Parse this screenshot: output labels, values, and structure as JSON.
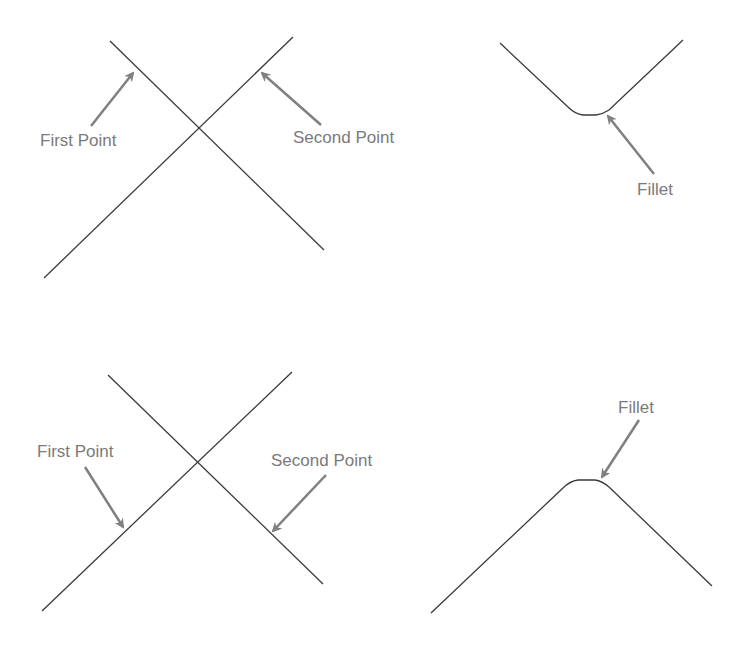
{
  "colors": {
    "background": "#ffffff",
    "line": "#3a3a3a",
    "arrow": "#808080",
    "label": "#7a7a7a"
  },
  "panels": [
    {
      "id": "top-left",
      "description": "Two intersecting lines before filleting",
      "labels": {
        "first": "First Point",
        "second": "Second Point"
      }
    },
    {
      "id": "top-right",
      "description": "Result: V-shaped corner with fillet at bottom",
      "labels": {
        "fillet": "Fillet"
      }
    },
    {
      "id": "bottom-left",
      "description": "Two intersecting lines before filleting, points picked on lower portions",
      "labels": {
        "first": "First Point",
        "second": "Second Point"
      }
    },
    {
      "id": "bottom-right",
      "description": "Result: inverted-V corner with fillet at top",
      "labels": {
        "fillet": "Fillet"
      }
    }
  ]
}
